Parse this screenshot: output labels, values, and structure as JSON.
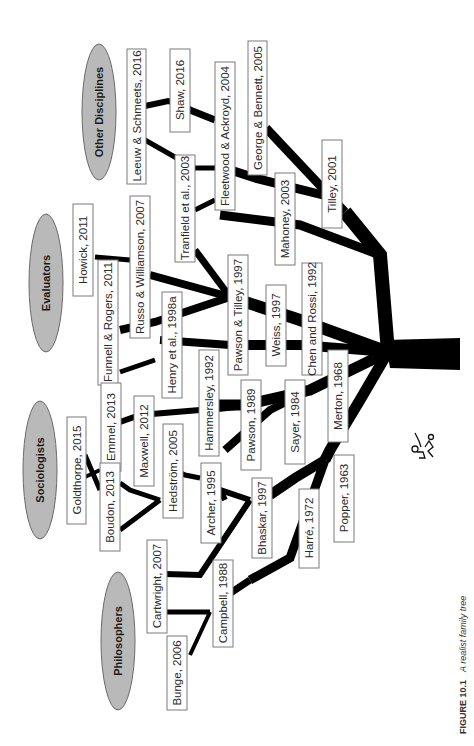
{
  "figure": {
    "caption_label": "FIGURE 10.1",
    "caption_text": "A realist family tree",
    "orientation": "rotated 90° counter-clockwise (roots at right, branches to left)"
  },
  "groups": [
    {
      "id": "other",
      "label": "Other Disciplines"
    },
    {
      "id": "evaluators",
      "label": "Evaluators"
    },
    {
      "id": "sociologists",
      "label": "Sociologists"
    },
    {
      "id": "philosophers",
      "label": "Philosophers"
    }
  ],
  "nodes": {
    "leeuw": "Leeuw & Schmeets, 2016",
    "shaw": "Shaw, 2016",
    "george": "George & Bennett, 2005",
    "fleetwood": "Fleetwood & Ackroyd, 2004",
    "tranfield": "Tranfield et al., 2003",
    "mahoney": "Mahoney, 2003",
    "tilley": "Tilley, 2001",
    "howick": "Howick, 2011",
    "russo": "Russo & Williamson, 2007",
    "funnell": "Funnell & Rogers, 2011",
    "henry": "Henry et al., 1998a",
    "pawson_tilley": "Pawson & Tilley, 1997",
    "weiss": "Weiss, 1997",
    "chen": "Chen and Rossi, 1992",
    "goldthorpe": "Goldthorpe, 2015",
    "emmel": "Emmel, 2013",
    "boudon": "Boudon, 2013",
    "maxwell": "Maxwell, 2012",
    "hedstrom": "Hedström, 2005",
    "hammersley": "Hammersley, 1992",
    "archer": "Archer, 1995",
    "pawson": "Pawson, 1989",
    "sayer": "Sayer, 1984",
    "merton": "Merton, 1968",
    "cartwright": "Cartwright, 2007",
    "campbell": "Campbell, 1988",
    "bhaskar": "Bhaskar, 1997",
    "harre": "Harré, 1972",
    "popper": "Popper, 1963",
    "bunge": "Bunge, 2006"
  },
  "colors": {
    "ellipse_fill": "#b9b9b9",
    "branch": "#000000",
    "box_border": "#7a7a7a",
    "background": "#ffffff"
  },
  "icons": {
    "doodle": "signature-doodle-icon"
  }
}
